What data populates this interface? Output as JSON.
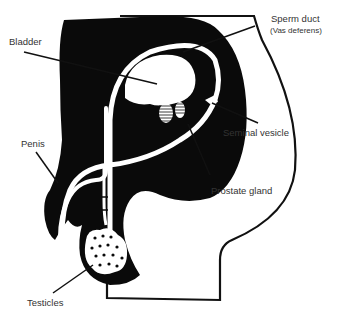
{
  "diagram": {
    "colors": {
      "tissue": "#0a0a0a",
      "background": "#ffffff",
      "outline": "#111111",
      "label_text": "#333333"
    },
    "labels": {
      "sperm_duct": "Sperm duct",
      "vas_deferens": "(Vas deferens)",
      "bladder": "Bladder",
      "seminal_vesicle": "Seminal vesicle",
      "penis": "Penis",
      "prostate_gland": "Prostate gland",
      "testicles": "Testicles"
    }
  }
}
